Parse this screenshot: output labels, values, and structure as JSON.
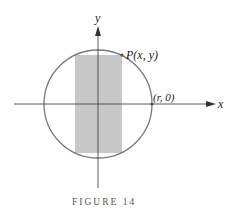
{
  "figure": {
    "caption": "FIGURE 14",
    "axes": {
      "x_label": "x",
      "y_label": "y"
    },
    "points": [
      {
        "label": "P(x, y)"
      },
      {
        "label": "(r, 0)"
      }
    ],
    "shapes": {
      "circle": {
        "description": "circle of radius r centered at origin",
        "stroke": "#7a7a7a"
      },
      "rectangle": {
        "description": "inscribed rectangle with corner P",
        "fill": "#c8c8c8"
      }
    }
  }
}
